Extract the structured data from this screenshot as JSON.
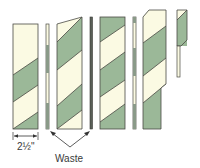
{
  "colors": {
    "cream": "#fbfae3",
    "green": "#9bb898",
    "outline": "#4a4a44",
    "waste": "#8a9a88",
    "arrow": "#333333"
  },
  "labels": {
    "width_dimension": "2½\"",
    "waste": "Waste"
  },
  "strips": [
    {
      "name": "strip-1",
      "kind": "pieced-strip"
    },
    {
      "name": "waste-strip-1",
      "kind": "waste"
    },
    {
      "name": "strip-2",
      "kind": "pieced-strip-trimmed-top-right"
    },
    {
      "name": "waste-strip-2",
      "kind": "waste"
    },
    {
      "name": "strip-3",
      "kind": "pieced-strip"
    },
    {
      "name": "waste-strip-3",
      "kind": "waste"
    },
    {
      "name": "strip-4",
      "kind": "pieced-strip-offset-top"
    },
    {
      "name": "strip-5",
      "kind": "short-offcut"
    }
  ]
}
